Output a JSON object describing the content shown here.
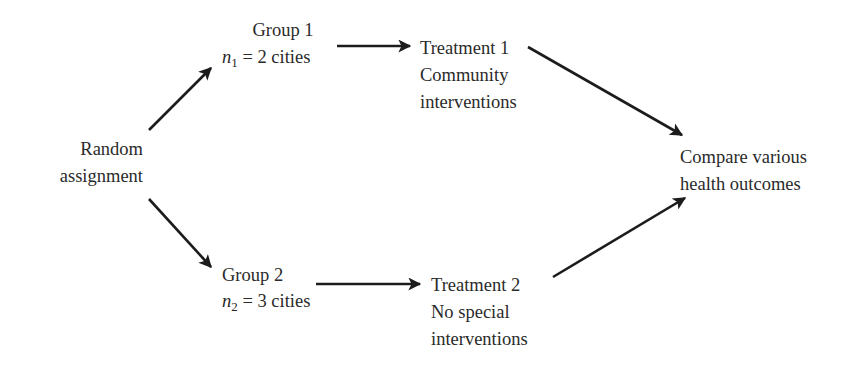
{
  "diagram": {
    "type": "flow",
    "nodes": {
      "random": {
        "lines": [
          "Random",
          "assignment"
        ]
      },
      "group1": {
        "title": "Group 1",
        "n_var": "n",
        "n_sub": "1",
        "n_text": " = 2 cities"
      },
      "group2": {
        "title": "Group 2",
        "n_var": "n",
        "n_sub": "2",
        "n_text": " = 3 cities"
      },
      "treatment1": {
        "lines": [
          "Treatment 1",
          "Community",
          "interventions"
        ]
      },
      "treatment2": {
        "lines": [
          "Treatment 2",
          "No special",
          "interventions"
        ]
      },
      "compare": {
        "lines": [
          "Compare various",
          "health outcomes"
        ]
      }
    },
    "edges": [
      {
        "from": "random",
        "to": "group1"
      },
      {
        "from": "random",
        "to": "group2"
      },
      {
        "from": "group1",
        "to": "treatment1"
      },
      {
        "from": "group2",
        "to": "treatment2"
      },
      {
        "from": "treatment1",
        "to": "compare"
      },
      {
        "from": "treatment2",
        "to": "compare"
      }
    ],
    "colors": {
      "text": "#2a2a2a",
      "arrow": "#1c1c1c",
      "background": "#ffffff"
    }
  }
}
